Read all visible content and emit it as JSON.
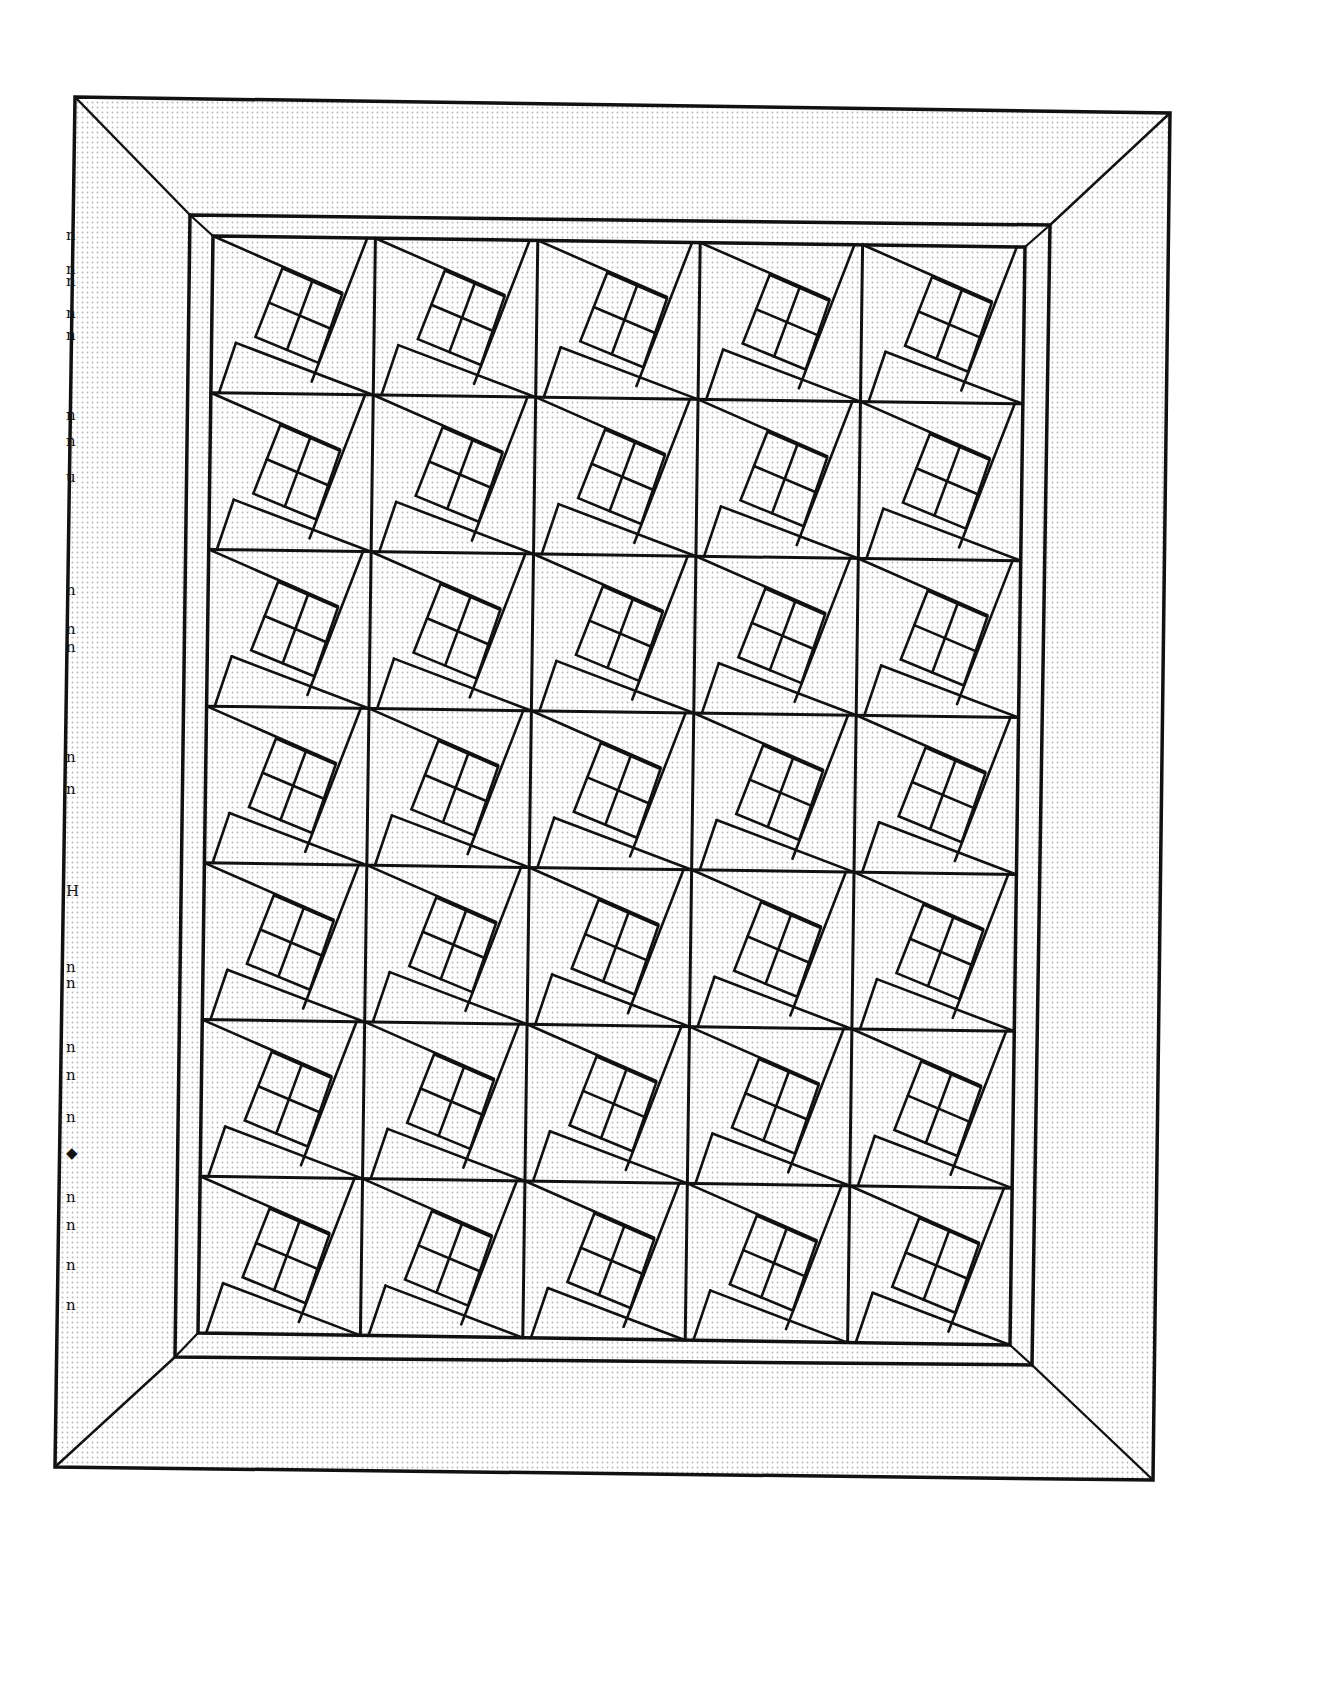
{
  "page": {
    "title": "",
    "background": "#ffffff",
    "ink_color": "#111111",
    "fill_dot_color": "#b5b5b5"
  },
  "quilt": {
    "outer_border": [
      [
        75,
        97
      ],
      [
        1170,
        113
      ],
      [
        1153,
        1480
      ],
      [
        55,
        1467
      ]
    ],
    "middle_frame": [
      [
        190,
        215
      ],
      [
        1050,
        225
      ],
      [
        1032,
        1365
      ],
      [
        175,
        1357
      ]
    ],
    "inner_frame": [
      [
        213,
        236
      ],
      [
        1025,
        247
      ],
      [
        1010,
        1345
      ],
      [
        198,
        1333
      ]
    ],
    "grid": {
      "columns": 5,
      "rows": 7
    },
    "block_pattern": "tilted square with 2x2 nine-patch-style inset and diagonal wedges",
    "stroke_widths": {
      "border": 3.5,
      "frame": 3.5,
      "grid": 3,
      "block": 2.6
    }
  },
  "margin_marks": [
    {
      "y": 228,
      "glyph": "n"
    },
    {
      "y": 262,
      "glyph": "n"
    },
    {
      "y": 274,
      "glyph": "n"
    },
    {
      "y": 306,
      "glyph": "n"
    },
    {
      "y": 328,
      "glyph": "n"
    },
    {
      "y": 408,
      "glyph": "n"
    },
    {
      "y": 434,
      "glyph": "n"
    },
    {
      "y": 470,
      "glyph": "u"
    },
    {
      "y": 583,
      "glyph": "n"
    },
    {
      "y": 622,
      "glyph": "n"
    },
    {
      "y": 640,
      "glyph": "n"
    },
    {
      "y": 750,
      "glyph": "n"
    },
    {
      "y": 782,
      "glyph": "n"
    },
    {
      "y": 884,
      "glyph": "H"
    },
    {
      "y": 960,
      "glyph": "n"
    },
    {
      "y": 976,
      "glyph": "n"
    },
    {
      "y": 1040,
      "glyph": "n"
    },
    {
      "y": 1068,
      "glyph": "n"
    },
    {
      "y": 1110,
      "glyph": "n"
    },
    {
      "y": 1146,
      "glyph": "◆"
    },
    {
      "y": 1190,
      "glyph": "n"
    },
    {
      "y": 1218,
      "glyph": "n"
    },
    {
      "y": 1258,
      "glyph": "n"
    },
    {
      "y": 1298,
      "glyph": "n"
    }
  ]
}
